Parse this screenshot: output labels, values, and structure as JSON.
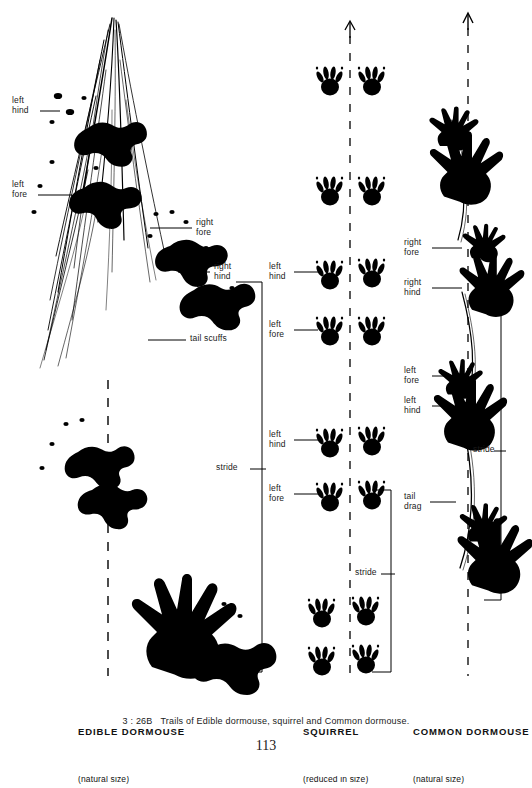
{
  "plate": {
    "figure_number": "3 : 26B",
    "caption": "3 : 26B   Trails of Edible dormouse, squirrel and Common dormouse.",
    "page_number": "113",
    "ink_color": "#000000",
    "background_color": "#ffffff"
  },
  "columns": [
    {
      "id": "edible-dormouse",
      "name": "EDIBLE DORMOUSE",
      "size_note": "(natural size)",
      "heading_x": 78,
      "heading_y": 690
    },
    {
      "id": "squirrel",
      "name": "SQUIRREL",
      "size_note": "(reduced in size)",
      "heading_x": 303,
      "heading_y": 690
    },
    {
      "id": "common-dormouse",
      "name": "COMMON DORMOUSE",
      "size_note": "(natural size)",
      "heading_x": 413,
      "heading_y": 690
    }
  ],
  "annotations": [
    {
      "id": "ed-left-hind",
      "text": "left\nhind",
      "x": 12,
      "y": 96,
      "align": "left"
    },
    {
      "id": "ed-left-fore",
      "text": "left\nfore",
      "x": 12,
      "y": 180,
      "align": "left"
    },
    {
      "id": "ed-right-fore",
      "text": "right\nfore",
      "x": 196,
      "y": 218,
      "align": "left"
    },
    {
      "id": "ed-right-hind",
      "text": "right\nhind",
      "x": 214,
      "y": 262,
      "align": "left"
    },
    {
      "id": "ed-tail-scuffs",
      "text": "tail scuffs",
      "x": 190,
      "y": 334,
      "align": "left"
    },
    {
      "id": "ed-stride",
      "text": "stride",
      "x": 216,
      "y": 466,
      "align": "left"
    },
    {
      "id": "sq-left-hind",
      "text": "left\nhind",
      "x": 269,
      "y": 262,
      "align": "left"
    },
    {
      "id": "sq-left-fore",
      "text": "left\nfore",
      "x": 269,
      "y": 320,
      "align": "left"
    },
    {
      "id": "sq-left-hind-2",
      "text": "left\nhind",
      "x": 269,
      "y": 428,
      "align": "left"
    },
    {
      "id": "sq-left-fore-2",
      "text": "left\nfore",
      "x": 269,
      "y": 482,
      "align": "left"
    },
    {
      "id": "sq-stride",
      "text": "stride",
      "x": 355,
      "y": 571,
      "align": "left"
    },
    {
      "id": "cd-right-fore",
      "text": "right\nfore",
      "x": 404,
      "y": 238,
      "align": "left"
    },
    {
      "id": "cd-right-hind",
      "text": "right\nhind",
      "x": 404,
      "y": 276,
      "align": "left"
    },
    {
      "id": "cd-left-fore",
      "text": "left\nfore",
      "x": 404,
      "y": 366,
      "align": "left"
    },
    {
      "id": "cd-left-hind",
      "text": "left\nhind",
      "x": 404,
      "y": 396,
      "align": "left"
    },
    {
      "id": "cd-stride",
      "text": "stride",
      "x": 473,
      "y": 448,
      "align": "left"
    },
    {
      "id": "cd-tail-drag",
      "text": "tail\ndrag",
      "x": 404,
      "y": 492,
      "align": "left"
    }
  ],
  "direction_arrows": [
    {
      "id": "arrow-squirrel",
      "x": 350,
      "top": 22
    },
    {
      "id": "arrow-common-dormouse",
      "x": 468,
      "top": 14
    }
  ],
  "track_columns_axes": [
    {
      "id": "axis-edible-dormouse",
      "x": 108,
      "y1": 30,
      "y2": 676
    },
    {
      "id": "axis-squirrel",
      "x": 350,
      "y1": 34,
      "y2": 676
    },
    {
      "id": "axis-common-dormouse",
      "x": 468,
      "y1": 26,
      "y2": 676
    }
  ],
  "stride_brackets": [
    {
      "id": "bracket-edible-dormouse",
      "x": 262,
      "y1": 282,
      "y2": 672,
      "tick_y": 466
    },
    {
      "id": "bracket-squirrel",
      "x": 391,
      "y1": 490,
      "y2": 672,
      "tick_y": 571
    },
    {
      "id": "bracket-common-dormouse",
      "x": 501,
      "y1": 290,
      "y2": 600,
      "tick_y": 448
    }
  ]
}
